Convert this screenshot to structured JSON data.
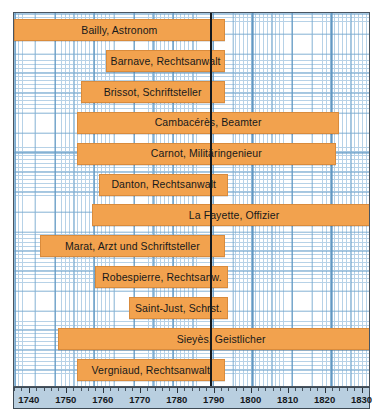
{
  "chart_data": {
    "type": "bar",
    "orientation": "horizontal",
    "subtype": "timeline-gantt",
    "title": "",
    "xlabel": "",
    "ylabel": "",
    "xlim": [
      1736,
      1832
    ],
    "grid": true,
    "legend": "none",
    "annotations": [
      {
        "name": "revolution-line",
        "x": 1789,
        "style": "vertical-black-line"
      }
    ],
    "categories": [
      "Bailly, Astronom",
      "Barnave, Rechtsanwalt",
      "Brissot, Schriftsteller",
      "Cambacérès, Beamter",
      "Carnot, Militäringenieur",
      "Danton, Rechtsanwalt",
      "La Fayette, Offizier",
      "Marat, Arzt und Schriftsteller",
      "Robespierre, Rechtsanw.",
      "Saint-Just, Schrst.",
      "Sieyès, Geistlicher",
      "Vergniaud, Rechtsanwalt"
    ],
    "bars": [
      {
        "label": "Bailly, Astronom",
        "start": 1736,
        "end": 1793
      },
      {
        "label": "Barnave, Rechtsanwalt",
        "start": 1761,
        "end": 1793
      },
      {
        "label": "Brissot, Schriftsteller",
        "start": 1754,
        "end": 1793
      },
      {
        "label": "Cambacérès, Beamter",
        "start": 1753,
        "end": 1824
      },
      {
        "label": "Carnot, Militäringenieur",
        "start": 1753,
        "end": 1823
      },
      {
        "label": "Danton, Rechtsanwalt",
        "start": 1759,
        "end": 1794
      },
      {
        "label": "La Fayette, Offizier",
        "start": 1757,
        "end": 1834
      },
      {
        "label": "Marat, Arzt und Schriftsteller",
        "start": 1743,
        "end": 1793
      },
      {
        "label": "Robespierre, Rechtsanw.",
        "start": 1758,
        "end": 1794
      },
      {
        "label": "Saint-Just, Schrst.",
        "start": 1767,
        "end": 1794
      },
      {
        "label": "Sieyès, Geistlicher",
        "start": 1748,
        "end": 1836
      },
      {
        "label": "Vergniaud, Rechtsanwalt",
        "start": 1753,
        "end": 1793
      }
    ]
  },
  "axis": {
    "ticks": [
      1740,
      1750,
      1760,
      1770,
      1780,
      1790,
      1800,
      1810,
      1820,
      1830
    ]
  }
}
